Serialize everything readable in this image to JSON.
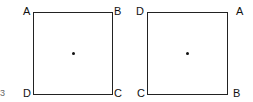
{
  "figures": [
    {
      "name": "square-1",
      "corners": {
        "top_left": "A",
        "top_right": "B",
        "bottom_right": "C",
        "bottom_left": "D"
      },
      "center_dot": true
    },
    {
      "name": "square-2",
      "corners": {
        "top_left": "D",
        "top_right": "A",
        "bottom_right": "B",
        "bottom_left": "C"
      },
      "center_dot": true
    }
  ],
  "stray_mark": "3"
}
